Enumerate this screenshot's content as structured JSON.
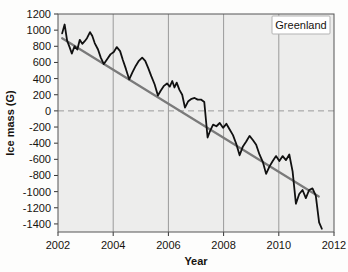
{
  "chart_data": {
    "type": "line",
    "title": "",
    "xlabel": "Year",
    "ylabel": "Ice mass (G)",
    "xlim": [
      2002,
      2012
    ],
    "ylim": [
      -1500,
      1200
    ],
    "xticks": [
      2002,
      2004,
      2006,
      2008,
      2010,
      2012
    ],
    "xtick_labels": [
      "2002",
      "2004",
      "2006",
      "2008",
      "2010",
      "2012"
    ],
    "yticks": [
      -1400,
      -1200,
      -1000,
      -800,
      -600,
      -400,
      -200,
      0,
      200,
      400,
      600,
      800,
      1000,
      1200
    ],
    "ytick_labels": [
      "-1400",
      "-1200",
      "-1000",
      "-800",
      "-600",
      "-400",
      "-200",
      "0",
      "200",
      "400",
      "600",
      "800",
      "1000",
      "1200"
    ],
    "grid": "vertical gridlines at 2004, 2006, 2008, 2010; dashed horizontal reference line at y=0",
    "legend": {
      "position": "top-right",
      "entries": [
        "Greenland"
      ]
    },
    "annotations": [
      {
        "text": "Greenland",
        "position": "top-right",
        "boxed": true
      }
    ],
    "plot_background": "#ededec",
    "series": [
      {
        "name": "Greenland ice mass anomaly",
        "style": "solid black line, seasonal oscillation",
        "color": "#111111",
        "x": [
          2002.15,
          2002.24,
          2002.33,
          2002.42,
          2002.5,
          2002.6,
          2002.7,
          2002.79,
          2002.88,
          2002.96,
          2003.05,
          2003.16,
          2003.24,
          2003.33,
          2003.45,
          2003.55,
          2003.66,
          2003.78,
          2003.9,
          2004.02,
          2004.13,
          2004.25,
          2004.35,
          2004.46,
          2004.58,
          2004.7,
          2004.82,
          2004.93,
          2005.05,
          2005.16,
          2005.27,
          2005.38,
          2005.5,
          2005.62,
          2005.72,
          2005.84,
          2005.95,
          2006.05,
          2006.14,
          2006.22,
          2006.3,
          2006.4,
          2006.5,
          2006.6,
          2006.72,
          2006.84,
          2006.95,
          2007.06,
          2007.18,
          2007.3,
          2007.42,
          2007.52,
          2007.62,
          2007.74,
          2007.86,
          2007.98,
          2008.1,
          2008.22,
          2008.34,
          2008.46,
          2008.58,
          2008.7,
          2008.82,
          2008.94,
          2009.06,
          2009.18,
          2009.3,
          2009.42,
          2009.54,
          2009.66,
          2009.78,
          2009.9,
          2010.02,
          2010.14,
          2010.26,
          2010.38,
          2010.5,
          2010.62,
          2010.74,
          2010.86,
          2010.98,
          2011.1,
          2011.22,
          2011.34,
          2011.46,
          2011.56
        ],
        "y": [
          960,
          1070,
          870,
          790,
          710,
          800,
          760,
          880,
          830,
          860,
          900,
          975,
          930,
          840,
          760,
          660,
          580,
          640,
          700,
          730,
          790,
          740,
          630,
          520,
          390,
          480,
          560,
          620,
          660,
          620,
          530,
          430,
          330,
          190,
          250,
          310,
          340,
          300,
          370,
          290,
          350,
          260,
          200,
          40,
          120,
          150,
          160,
          140,
          140,
          110,
          -330,
          -240,
          -170,
          -190,
          -150,
          -210,
          -160,
          -230,
          -300,
          -410,
          -550,
          -440,
          -380,
          -310,
          -360,
          -420,
          -540,
          -630,
          -780,
          -690,
          -620,
          -560,
          -620,
          -560,
          -610,
          -540,
          -750,
          -1150,
          -1030,
          -980,
          -1080,
          -980,
          -960,
          -1050,
          -1380,
          -1460
        ]
      },
      {
        "name": "Linear trend",
        "style": "solid gray line",
        "color": "#7a7a7a",
        "x": [
          2002.15,
          2011.45
        ],
        "y": [
          900,
          -1060
        ]
      }
    ]
  },
  "legend_label": "Greenland",
  "axes": {
    "y_title": "Ice mass (G)",
    "x_title": "Year"
  }
}
